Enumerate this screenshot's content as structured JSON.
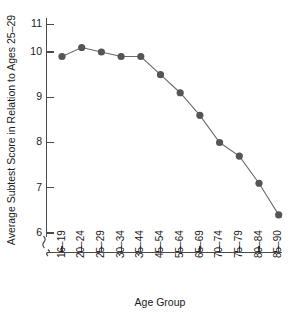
{
  "chart_data": {
    "type": "line",
    "title": "",
    "xlabel": "Age Group",
    "ylabel": "Average Subtest Score in Relation to Ages 25–29",
    "categories": [
      "16–19",
      "20–24",
      "25–29",
      "30–34",
      "35–44",
      "45–54",
      "55–64",
      "65–69",
      "70–74",
      "75–79",
      "80–84",
      "85–90"
    ],
    "values": [
      9.9,
      10.1,
      10.0,
      9.9,
      9.9,
      9.5,
      9.1,
      8.6,
      8.0,
      7.7,
      7.1,
      6.4
    ],
    "series": [
      {
        "name": "Average Subtest Score",
        "values": [
          9.9,
          10.1,
          10.0,
          9.9,
          9.9,
          9.5,
          9.1,
          8.6,
          8.0,
          7.7,
          7.1,
          6.4
        ]
      }
    ],
    "yticks": [
      6,
      7,
      8,
      9,
      10,
      11
    ],
    "ytick_labels": [
      "6",
      "7",
      "8",
      "9",
      "10",
      "11"
    ],
    "ylim": [
      6,
      11
    ],
    "y_axis_break": true,
    "x_axis_break": true,
    "grid": false,
    "legend": false,
    "legend_position": "none",
    "marker": "circle",
    "marker_color": "#555555",
    "line_color": "#6b6b6b",
    "axis_color": "#4a4a4a",
    "background_color": "#ffffff"
  },
  "axes": {
    "y_title": "Average Subtest Score in Relation to Ages 25–29",
    "x_title": "Age Group",
    "y_labels": [
      "11",
      "10",
      "9",
      "8",
      "7",
      "6"
    ],
    "x_labels": [
      "16–19",
      "20–24",
      "25–29",
      "30–34",
      "35–44",
      "45–54",
      "55–64",
      "65–69",
      "70–74",
      "75–79",
      "80–84",
      "85–90"
    ]
  }
}
